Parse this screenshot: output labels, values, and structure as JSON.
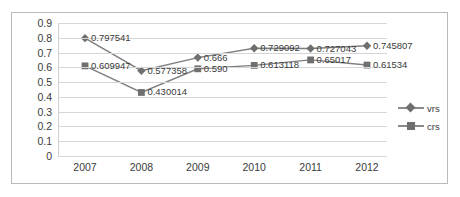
{
  "chart_data": {
    "type": "line",
    "title": "",
    "xlabel": "",
    "ylabel": "",
    "categories": [
      "2007",
      "2008",
      "2009",
      "2010",
      "2011",
      "2012"
    ],
    "ylim": [
      0,
      0.9
    ],
    "ytick_labels": [
      "0.9",
      "0.8",
      "0.7",
      "0.6",
      "0.5",
      "0.4",
      "0.3",
      "0.2",
      "0.1",
      "0"
    ],
    "ytick_values": [
      0.9,
      0.8,
      0.7,
      0.6,
      0.5,
      0.4,
      0.3,
      0.2,
      0.1,
      0
    ],
    "grid": true,
    "legend_position": "right",
    "series": [
      {
        "name": "vrs",
        "marker": "diamond",
        "color": "#7f7f7f",
        "values": [
          0.797541,
          0.577358,
          0.666,
          0.729092,
          0.727043,
          0.745807
        ],
        "labels": [
          "0.797541",
          "0.577358",
          "0.666",
          "0.729092",
          "0.727043",
          "0.745807"
        ]
      },
      {
        "name": "crs",
        "marker": "square",
        "color": "#7f7f7f",
        "values": [
          0.609947,
          0.430014,
          0.59,
          0.613118,
          0.65017,
          0.61534
        ],
        "labels": [
          "0.609947",
          "0.430014",
          "0.590",
          "0.613118",
          "0.65017",
          "0.61534"
        ]
      }
    ]
  },
  "legend": {
    "items": [
      {
        "label": "vrs"
      },
      {
        "label": "crs"
      }
    ]
  }
}
